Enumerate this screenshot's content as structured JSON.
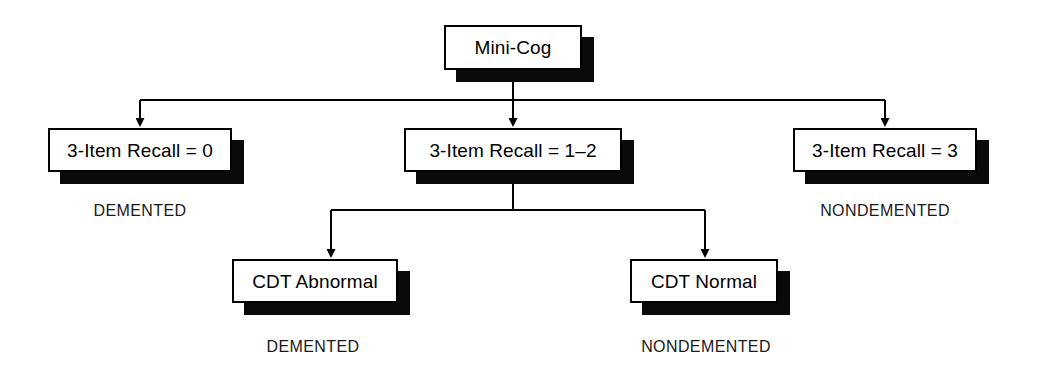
{
  "diagram": {
    "type": "decision-tree",
    "root": {
      "id": "mini-cog",
      "label": "Mini-Cog"
    },
    "level1": [
      {
        "id": "recall-0",
        "label": "3-Item Recall = 0",
        "outcome": "DEMENTED"
      },
      {
        "id": "recall-1-2",
        "label": "3-Item Recall = 1–2",
        "outcome": null
      },
      {
        "id": "recall-3",
        "label": "3-Item Recall = 3",
        "outcome": "NONDEMENTED"
      }
    ],
    "level2": [
      {
        "id": "cdt-abnormal",
        "label": "CDT Abnormal",
        "outcome": "DEMENTED"
      },
      {
        "id": "cdt-normal",
        "label": "CDT Normal",
        "outcome": "NONDEMENTED"
      }
    ],
    "colors": {
      "background": "#ffffff",
      "box_fill": "#ffffff",
      "border": "#000000",
      "shadow": "#0a0a0a",
      "text": "#000000"
    }
  }
}
